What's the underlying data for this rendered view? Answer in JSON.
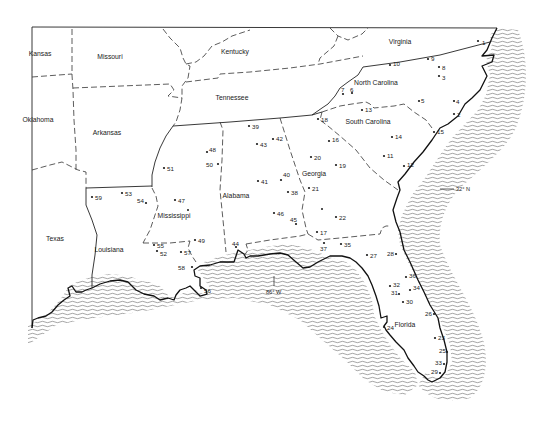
{
  "map": {
    "title": "",
    "states": [
      {
        "name": "Kansas",
        "x": 40,
        "y": 56
      },
      {
        "name": "Missouri",
        "x": 110,
        "y": 59
      },
      {
        "name": "Kentucky",
        "x": 235,
        "y": 54
      },
      {
        "name": "Virginia",
        "x": 400,
        "y": 44
      },
      {
        "name": "North Carolina",
        "x": 376,
        "y": 85
      },
      {
        "name": "Tennessee",
        "x": 232,
        "y": 100
      },
      {
        "name": "Oklahoma",
        "x": 38,
        "y": 122
      },
      {
        "name": "Arkansas",
        "x": 107,
        "y": 135
      },
      {
        "name": "South Carolina",
        "x": 368,
        "y": 124
      },
      {
        "name": "Georgia",
        "x": 314,
        "y": 176
      },
      {
        "name": "Alabama",
        "x": 236,
        "y": 198
      },
      {
        "name": "Mississippi",
        "x": 174,
        "y": 218
      },
      {
        "name": "Texas",
        "x": 55,
        "y": 241
      },
      {
        "name": "Louisiana",
        "x": 109,
        "y": 252
      },
      {
        "name": "Florida",
        "x": 405,
        "y": 327
      }
    ],
    "stations": [
      {
        "id": "1",
        "dx": 478,
        "dy": 41,
        "lx": 482,
        "ly": 43
      },
      {
        "id": "2",
        "dx": 454,
        "dy": 114,
        "lx": 457,
        "ly": 115
      },
      {
        "id": "3",
        "dx": 439,
        "dy": 76,
        "lx": 442,
        "ly": 78
      },
      {
        "id": "4",
        "dx": 454,
        "dy": 101,
        "lx": 456,
        "ly": 102
      },
      {
        "id": "5",
        "dx": 419,
        "dy": 101,
        "lx": 421,
        "ly": 101
      },
      {
        "id": "6",
        "dx": 352,
        "dy": 93,
        "lx": 350,
        "ly": 90
      },
      {
        "id": "7",
        "dx": 343,
        "dy": 94,
        "lx": 341,
        "ly": 90
      },
      {
        "id": "8",
        "dx": 439,
        "dy": 67,
        "lx": 442,
        "ly": 68
      },
      {
        "id": "9",
        "dx": 428,
        "dy": 59,
        "lx": 431,
        "ly": 59
      },
      {
        "id": "10",
        "dx": 390,
        "dy": 65,
        "lx": 393,
        "ly": 64
      },
      {
        "id": "11",
        "dx": 384,
        "dy": 156,
        "lx": 387,
        "ly": 156
      },
      {
        "id": "12",
        "dx": 404,
        "dy": 166,
        "lx": 407,
        "ly": 165
      },
      {
        "id": "13",
        "dx": 362,
        "dy": 110,
        "lx": 365,
        "ly": 110
      },
      {
        "id": "14",
        "dx": 392,
        "dy": 137,
        "lx": 395,
        "ly": 137
      },
      {
        "id": "15",
        "dx": 434,
        "dy": 132,
        "lx": 437,
        "ly": 132
      },
      {
        "id": "16",
        "dx": 329,
        "dy": 141,
        "lx": 332,
        "ly": 140
      },
      {
        "id": "17",
        "dx": 317,
        "dy": 232,
        "lx": 320,
        "ly": 233
      },
      {
        "id": "18",
        "dx": 318,
        "dy": 119,
        "lx": 321,
        "ly": 120
      },
      {
        "id": "19",
        "dx": 336,
        "dy": 165,
        "lx": 339,
        "ly": 166
      },
      {
        "id": "20",
        "dx": 311,
        "dy": 157,
        "lx": 314,
        "ly": 158
      },
      {
        "id": "21",
        "dx": 309,
        "dy": 188,
        "lx": 312,
        "ly": 189
      },
      {
        "id": "22",
        "dx": 336,
        "dy": 217,
        "lx": 339,
        "ly": 218
      },
      {
        "id": "23",
        "dx": 435,
        "dy": 338,
        "lx": 438,
        "ly": 338
      },
      {
        "id": "24",
        "dx": 384,
        "dy": 327,
        "lx": 387,
        "ly": 328
      },
      {
        "id": "25",
        "dx": 447,
        "dy": 352,
        "lx": 439,
        "ly": 351
      },
      {
        "id": "26",
        "dx": 434,
        "dy": 314,
        "lx": 425,
        "ly": 314
      },
      {
        "id": "27",
        "dx": 367,
        "dy": 255,
        "lx": 370,
        "ly": 256
      },
      {
        "id": "28",
        "dx": 396,
        "dy": 254,
        "lx": 387,
        "ly": 254
      },
      {
        "id": "29",
        "dx": 440,
        "dy": 373,
        "lx": 431,
        "ly": 372
      },
      {
        "id": "30",
        "dx": 403,
        "dy": 302,
        "lx": 406,
        "ly": 302
      },
      {
        "id": "31",
        "dx": 399,
        "dy": 294,
        "lx": 391,
        "ly": 293
      },
      {
        "id": "32",
        "dx": 390,
        "dy": 286,
        "lx": 393,
        "ly": 285
      },
      {
        "id": "33",
        "dx": 444,
        "dy": 364,
        "lx": 435,
        "ly": 363
      },
      {
        "id": "34",
        "dx": 410,
        "dy": 290,
        "lx": 413,
        "ly": 288
      },
      {
        "id": "35",
        "dx": 341,
        "dy": 244,
        "lx": 344,
        "ly": 245
      },
      {
        "id": "36",
        "dx": 406,
        "dy": 277,
        "lx": 409,
        "ly": 276
      },
      {
        "id": "37",
        "dx": 324,
        "dy": 243,
        "lx": 320,
        "ly": 249
      },
      {
        "id": "38",
        "dx": 288,
        "dy": 192,
        "lx": 291,
        "ly": 193
      },
      {
        "id": "39",
        "dx": 249,
        "dy": 126,
        "lx": 252,
        "ly": 127
      },
      {
        "id": "40",
        "dx": 281,
        "dy": 180,
        "lx": 283,
        "ly": 175
      },
      {
        "id": "41",
        "dx": 258,
        "dy": 181,
        "lx": 261,
        "ly": 182
      },
      {
        "id": "42",
        "dx": 273,
        "dy": 139,
        "lx": 276,
        "ly": 139
      },
      {
        "id": "43",
        "dx": 257,
        "dy": 144,
        "lx": 260,
        "ly": 145
      },
      {
        "id": "44",
        "dx": 236,
        "dy": 247,
        "lx": 232,
        "ly": 244
      },
      {
        "id": "45",
        "dx": 296,
        "dy": 224,
        "lx": 290,
        "ly": 220
      },
      {
        "id": "46",
        "dx": 274,
        "dy": 213,
        "lx": 277,
        "ly": 214
      },
      {
        "id": "47",
        "dx": 175,
        "dy": 200,
        "lx": 178,
        "ly": 201
      },
      {
        "id": "48",
        "dx": 207,
        "dy": 152,
        "lx": 209,
        "ly": 150
      },
      {
        "id": "49",
        "dx": 195,
        "dy": 240,
        "lx": 198,
        "ly": 241
      },
      {
        "id": "50",
        "dx": 218,
        "dy": 164,
        "lx": 206,
        "ly": 165
      },
      {
        "id": "51",
        "dx": 164,
        "dy": 168,
        "lx": 167,
        "ly": 169
      },
      {
        "id": "52",
        "dx": 157,
        "dy": 251,
        "lx": 160,
        "ly": 254
      },
      {
        "id": "53",
        "dx": 122,
        "dy": 193,
        "lx": 125,
        "ly": 194
      },
      {
        "id": "54",
        "dx": 146,
        "dy": 203,
        "lx": 137,
        "ly": 201
      },
      {
        "id": "55",
        "dx": 154,
        "dy": 245,
        "lx": 157,
        "ly": 246
      },
      {
        "id": "56",
        "dx": 201,
        "dy": 288,
        "lx": 204,
        "ly": 291
      },
      {
        "id": "57",
        "dx": 181,
        "dy": 252,
        "lx": 184,
        "ly": 253
      },
      {
        "id": "58",
        "dx": 192,
        "dy": 267,
        "lx": 178,
        "ly": 268
      },
      {
        "id": "59",
        "dx": 92,
        "dy": 197,
        "lx": 95,
        "ly": 198
      }
    ],
    "unlabeled_points": [
      {
        "x": 322,
        "y": 209
      },
      {
        "x": 188,
        "y": 210
      }
    ],
    "axis_markers": {
      "latitude": {
        "label": "32° N",
        "x": 456,
        "y": 190
      },
      "longitude": {
        "label": "86° W",
        "x": 274,
        "y": 290
      }
    },
    "colors": {
      "ink": "#1a1a1a",
      "background": "#ffffff",
      "water_hatch": "#555555"
    }
  }
}
